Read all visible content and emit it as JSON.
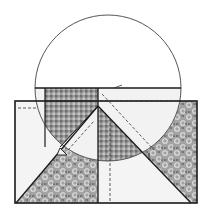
{
  "diagram": {
    "colors": {
      "background": "#ffffff",
      "outline": "#1a1a1a",
      "circle_stroke": "#555555",
      "light_fill": "#f2f2f2",
      "gingham_dark": "#8a8a8a",
      "gingham_light": "#c4c4c4",
      "floral_base": "#9c9c9c",
      "floral_spot": "#dcdcdc",
      "dash": "#333333"
    },
    "shapes": {
      "rectangle": {
        "x": 15,
        "y": 101,
        "w": 182,
        "h": 102
      },
      "circle": {
        "cx": 108,
        "cy": 88,
        "r": 73
      },
      "chord_y": 88,
      "center_vertical_x": 98,
      "apex": [
        98,
        106
      ]
    },
    "pieces": [
      {
        "name": "gingham-left",
        "fabric": "gingham"
      },
      {
        "name": "gingham-center",
        "fabric": "gingham"
      },
      {
        "name": "floral-bottom-left",
        "fabric": "floral"
      },
      {
        "name": "floral-right",
        "fabric": "floral"
      },
      {
        "name": "plain-left",
        "fabric": "plain"
      },
      {
        "name": "plain-top-right",
        "fabric": "plain"
      },
      {
        "name": "plain-bottom-right",
        "fabric": "plain"
      },
      {
        "name": "plain-center-wedge",
        "fabric": "plain"
      }
    ]
  }
}
